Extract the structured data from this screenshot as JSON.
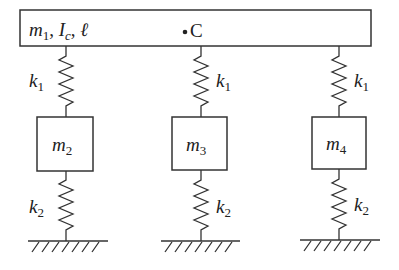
{
  "beam": {
    "label_m": "m",
    "label_m_sub": "1",
    "label_sep1": ", ",
    "label_I": "I",
    "label_I_sub": "c",
    "label_sep2": ", ",
    "label_l": "ℓ",
    "center_label": "C"
  },
  "upper_springs": [
    {
      "label": "k",
      "sub": "1",
      "side": "left"
    },
    {
      "label": "k",
      "sub": "1",
      "side": "right"
    },
    {
      "label": "k",
      "sub": "1",
      "side": "right"
    }
  ],
  "masses": [
    {
      "label": "m",
      "sub": "2"
    },
    {
      "label": "m",
      "sub": "3"
    },
    {
      "label": "m",
      "sub": "4"
    }
  ],
  "lower_springs": [
    {
      "label": "k",
      "sub": "2",
      "side": "left"
    },
    {
      "label": "k",
      "sub": "2",
      "side": "right"
    },
    {
      "label": "k",
      "sub": "2",
      "side": "right"
    }
  ],
  "colors": {
    "stroke": "#333333",
    "text": "#222222",
    "background": "#ffffff"
  }
}
